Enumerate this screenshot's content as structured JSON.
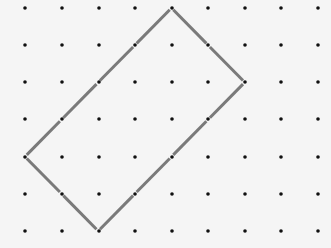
{
  "board": {
    "background": "#f5f5f5",
    "dot_color": "#111111",
    "line_color": "#7a7a7a",
    "grid": {
      "columns": 9,
      "rows": 7,
      "x_positions": [
        25,
        62,
        99,
        135,
        172,
        208,
        245,
        281,
        318
      ],
      "y_positions": [
        8,
        45,
        82,
        119,
        157,
        194,
        231
      ]
    },
    "polygon": {
      "label": "rectangle",
      "vertices_grid": [
        [
          4,
          0
        ],
        [
          6,
          2
        ],
        [
          2,
          6
        ],
        [
          0,
          4
        ]
      ]
    }
  }
}
